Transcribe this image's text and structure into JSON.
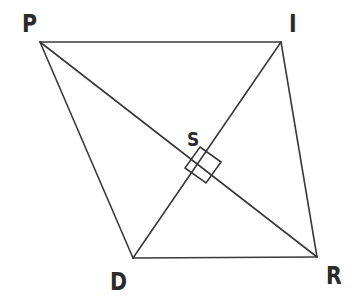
{
  "figure": {
    "kind": "geometry-diagram",
    "background_color": "#ffffff",
    "stroke_color": "#3a3a3a",
    "label_color": "#2b2b2b",
    "stroke_width": 1.6,
    "canvas": {
      "width": 358,
      "height": 301
    },
    "vertices": [
      {
        "id": "P",
        "label": "P",
        "x": 40,
        "y": 42,
        "label_x": 22,
        "label_y": 11
      },
      {
        "id": "I",
        "label": "I",
        "x": 281,
        "y": 42,
        "label_x": 289,
        "label_y": 11
      },
      {
        "id": "D",
        "label": "D",
        "x": 133,
        "y": 258,
        "label_x": 110,
        "label_y": 269
      },
      {
        "id": "R",
        "label": "R",
        "x": 317,
        "y": 257,
        "label_x": 326,
        "label_y": 263
      }
    ],
    "intersection": {
      "id": "S",
      "label": "S",
      "x": 192,
      "y": 161,
      "label_x": 187,
      "label_y": 129
    },
    "sides": [
      {
        "id": "PI",
        "from": "P",
        "to": "I",
        "x1": 40,
        "y1": 42,
        "x2": 281,
        "y2": 42
      },
      {
        "id": "IR",
        "from": "I",
        "to": "R",
        "x1": 281,
        "y1": 42,
        "x2": 317,
        "y2": 257
      },
      {
        "id": "RD",
        "from": "R",
        "to": "D",
        "x1": 317,
        "y1": 257,
        "x2": 133,
        "y2": 258
      },
      {
        "id": "DP",
        "from": "D",
        "to": "P",
        "x1": 133,
        "y1": 258,
        "x2": 40,
        "y2": 42
      }
    ],
    "diagonals": [
      {
        "id": "PR",
        "from": "P",
        "to": "R",
        "x1": 40,
        "y1": 42,
        "x2": 317,
        "y2": 257
      },
      {
        "id": "ID",
        "from": "I",
        "to": "D",
        "x1": 281,
        "y1": 42,
        "x2": 133,
        "y2": 258
      }
    ],
    "right_angle_marker": {
      "id": "right-angle-at-S",
      "points": "200,147 221,162 206,183 185,168",
      "size": 25
    }
  }
}
